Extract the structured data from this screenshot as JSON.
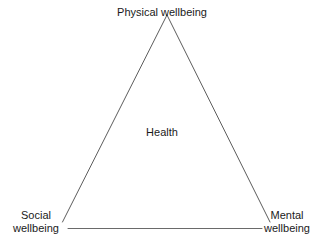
{
  "diagram": {
    "shape": "triangle",
    "background_color": "#ffffff",
    "line_color": "#4a4a4a",
    "text_color": "#1a1a1a",
    "center_label": "Health",
    "vertices": [
      {
        "id": "apex",
        "position": "top",
        "label": "Physical wellbeing",
        "lines": [
          "Physical wellbeing"
        ],
        "x": 167,
        "y": 14
      },
      {
        "id": "bottom-left",
        "position": "bottom-left",
        "label": "Social wellbeing",
        "lines": [
          "Social",
          "wellbeing"
        ],
        "x": 62,
        "y": 222
      },
      {
        "id": "bottom-right",
        "position": "bottom-right",
        "label": "Mental wellbeing",
        "lines": [
          "Mental",
          "wellbeing"
        ],
        "x": 270,
        "y": 222
      }
    ]
  }
}
